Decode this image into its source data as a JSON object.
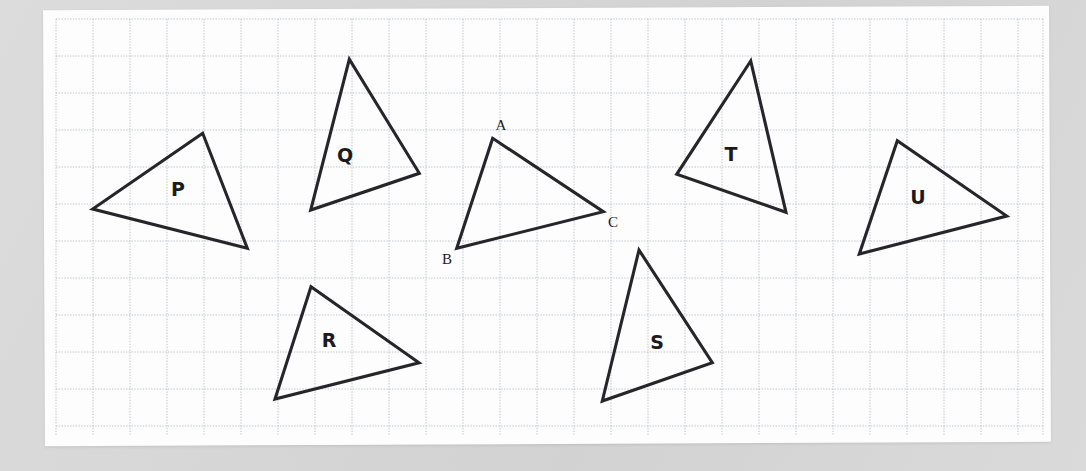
{
  "page": {
    "width": 1086,
    "height": 471,
    "background_color": "#d8d8d8",
    "paper_color": "#fdfdfd"
  },
  "grid": {
    "origin_x": 56,
    "origin_y": 19,
    "width": 987,
    "height": 416,
    "cell_size": 37,
    "columns": 27,
    "rows": 11,
    "line_color": "#b9bec4",
    "style": "dotted"
  },
  "diagram": {
    "type": "congruent-triangles-worksheet",
    "stroke_color": "#26262a",
    "stroke_width": 3.1,
    "reference_triangle": {
      "name": "ABC",
      "vertices": [
        {
          "label": "A",
          "x": 492.7,
          "y": 138.3,
          "label_x": 501.0,
          "label_y": 127.0
        },
        {
          "label": "B",
          "x": 456.7,
          "y": 248.3,
          "label_x": 447.0,
          "label_y": 261.0
        },
        {
          "label": "C",
          "x": 603.3,
          "y": 211.7,
          "label_x": 613.0,
          "label_y": 224.0
        }
      ]
    },
    "labelled_triangles": [
      {
        "label": "P",
        "label_x": 178,
        "label_y": 190,
        "vertices": [
          {
            "x": 202.7,
            "y": 133.3
          },
          {
            "x": 92.7,
            "y": 209.0
          },
          {
            "x": 247.3,
            "y": 248.3
          }
        ]
      },
      {
        "label": "Q",
        "label_x": 345,
        "label_y": 156,
        "vertices": [
          {
            "x": 349.3,
            "y": 59.3
          },
          {
            "x": 310.7,
            "y": 210.0
          },
          {
            "x": 419.3,
            "y": 173.3
          }
        ]
      },
      {
        "label": "R",
        "label_x": 329,
        "label_y": 341,
        "vertices": [
          {
            "x": 311.0,
            "y": 286.7
          },
          {
            "x": 275.0,
            "y": 399.0
          },
          {
            "x": 419.0,
            "y": 362.7
          }
        ]
      },
      {
        "label": "S",
        "label_x": 657,
        "label_y": 343,
        "vertices": [
          {
            "x": 639.0,
            "y": 250.0
          },
          {
            "x": 602.3,
            "y": 401.0
          },
          {
            "x": 712.3,
            "y": 362.7
          }
        ]
      },
      {
        "label": "T",
        "label_x": 731,
        "label_y": 155,
        "vertices": [
          {
            "x": 750.7,
            "y": 61.0
          },
          {
            "x": 676.7,
            "y": 174.3
          },
          {
            "x": 786.0,
            "y": 212.3
          }
        ]
      },
      {
        "label": "U",
        "label_x": 918,
        "label_y": 198,
        "vertices": [
          {
            "x": 897.3,
            "y": 140.7
          },
          {
            "x": 859.3,
            "y": 254.0
          },
          {
            "x": 1006.7,
            "y": 216.0
          }
        ]
      }
    ]
  }
}
